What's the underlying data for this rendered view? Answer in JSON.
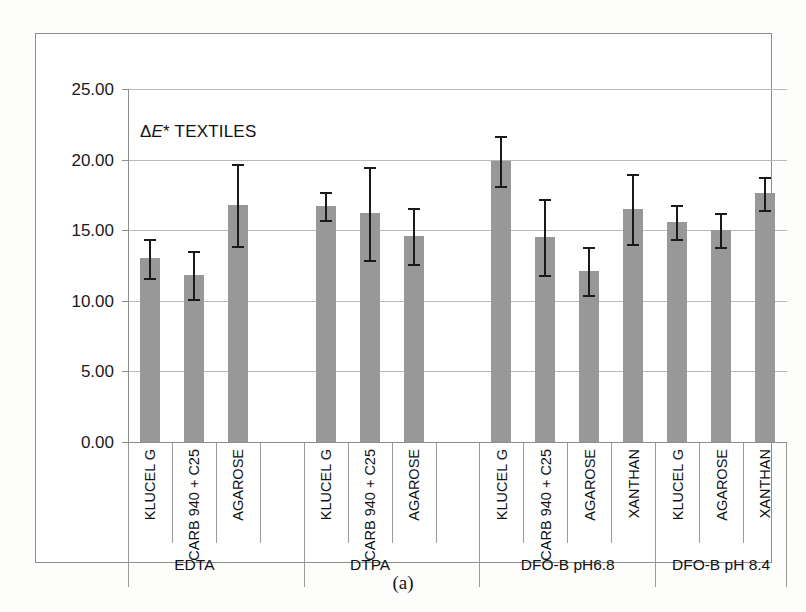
{
  "figure": {
    "caption": "(a)",
    "chart_title": "ΔE* TEXTILES",
    "chart_title_prefix": "Δ",
    "chart_title_italic": "E",
    "chart_title_suffix": "* TEXTILES"
  },
  "axis": {
    "y_ticks": [
      "25.00",
      "20.00",
      "15.00",
      "10.00",
      "5.00",
      "0.00"
    ],
    "y_tick_values": [
      25,
      20,
      15,
      10,
      5,
      0
    ]
  },
  "chart_data": {
    "type": "bar",
    "title": "ΔE* TEXTILES",
    "xlabel": "",
    "ylabel": "",
    "ylim": [
      0,
      25
    ],
    "ytick_step": 5,
    "grid": true,
    "legend": "none",
    "error_bars": "symmetric",
    "bar_color": "#989898",
    "groups": [
      {
        "name": "EDTA",
        "categories": [
          "KLUCEL G",
          "CARB 940 + C25",
          "AGAROSE"
        ],
        "values": [
          13.0,
          11.8,
          16.8
        ],
        "errors": [
          1.4,
          1.7,
          2.9
        ],
        "empty_slots": 1
      },
      {
        "name": "DTPA",
        "categories": [
          "KLUCEL G",
          "CARB 940 + C25",
          "AGAROSE"
        ],
        "values": [
          16.7,
          16.2,
          14.6
        ],
        "errors": [
          1.0,
          3.3,
          2.0
        ],
        "empty_slots": 1
      },
      {
        "name": "DFO-B pH6.8",
        "categories": [
          "KLUCEL G",
          "CARB 940 + C25",
          "AGAROSE",
          "XANTHAN"
        ],
        "values": [
          19.9,
          14.5,
          12.1,
          16.5
        ],
        "errors": [
          1.8,
          2.7,
          1.7,
          2.5
        ],
        "empty_slots": 0
      },
      {
        "name": "DFO-B pH 8.4",
        "categories": [
          "KLUCEL G",
          "AGAROSE",
          "XANTHAN"
        ],
        "values": [
          15.6,
          15.0,
          17.6
        ],
        "errors": [
          1.2,
          1.2,
          1.2
        ],
        "empty_slots": 0
      }
    ]
  }
}
